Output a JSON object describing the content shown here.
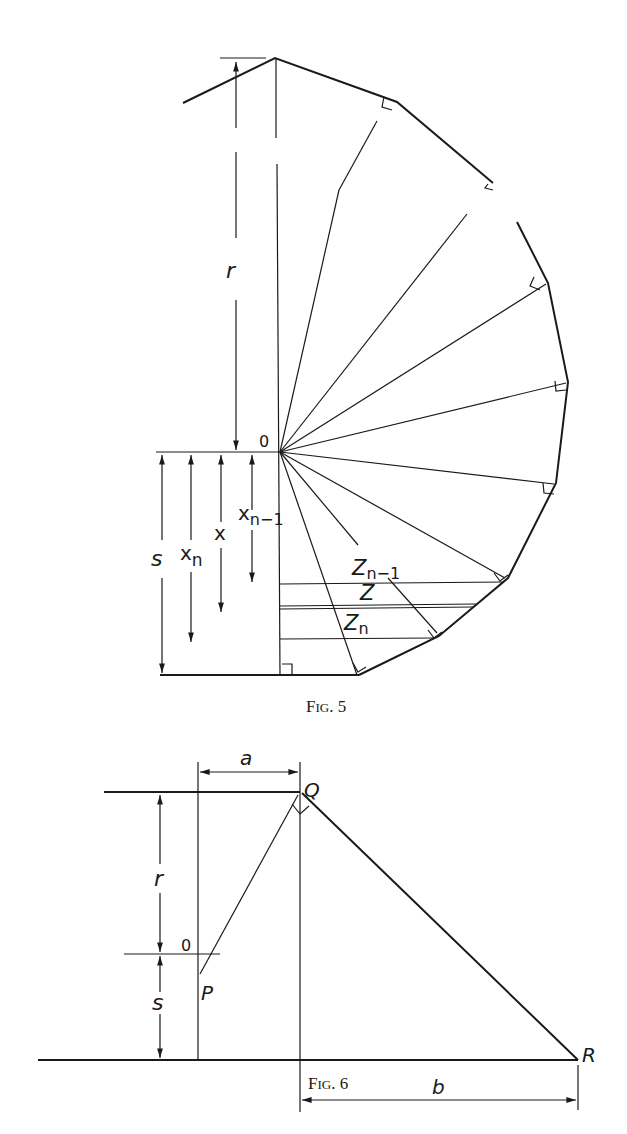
{
  "figures": [
    {
      "id": "fig5",
      "caption_prefix": "F",
      "caption_small": "IG",
      "caption_number": ". 5",
      "labels": {
        "r": "r",
        "origin": "0",
        "s": "s",
        "x_n_base": "x",
        "x_n_sub": "n",
        "x": "x",
        "x_n1_base": "x",
        "x_n1_sub": "n−1",
        "z_n1_base": "Z",
        "z_n1_sub": "n−1",
        "z": "Z",
        "z_n_base": "Z",
        "z_n_sub": "n"
      }
    },
    {
      "id": "fig6",
      "caption_prefix": "F",
      "caption_small": "IG",
      "caption_number": ". 6",
      "labels": {
        "a": "a",
        "Q": "Q",
        "r": "r",
        "origin": "0",
        "P": "P",
        "s": "s",
        "R": "R",
        "b": "b"
      }
    }
  ],
  "colors": {
    "ink": "#1a1a1a",
    "paper": "#ffffff"
  }
}
